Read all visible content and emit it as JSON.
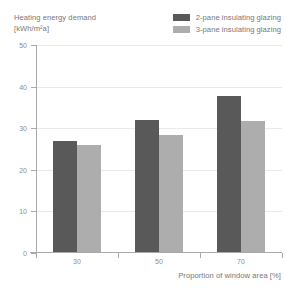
{
  "chart_data": {
    "type": "bar",
    "title": "Heating energy demand",
    "subtitle": "[kWh/m²a]",
    "xlabel": "Proportion of window area [%]",
    "ylabel": "",
    "categories": [
      "30",
      "50",
      "70"
    ],
    "series": [
      {
        "name": "2-pane insulating glazing",
        "color": "#595959",
        "values": [
          27,
          32,
          37.8
        ]
      },
      {
        "name": "3-pane insulating glazing",
        "color": "#adadad",
        "values": [
          26,
          28.3,
          31.8
        ]
      }
    ],
    "ylim": [
      0,
      50
    ],
    "yticks": [
      0,
      10,
      20,
      30,
      40,
      50
    ],
    "ytick_labels": [
      "0",
      "10",
      "20",
      "30",
      "40",
      "50"
    ],
    "grid": true,
    "legend_position": "top-right"
  },
  "colors": {
    "series_dark": "#595959",
    "series_light": "#adadad",
    "grid": "#e9e8ea",
    "axis": "#a9a8ab",
    "text": "#77767a",
    "tick_text": "#8d8c90",
    "background": "#ffffff"
  }
}
